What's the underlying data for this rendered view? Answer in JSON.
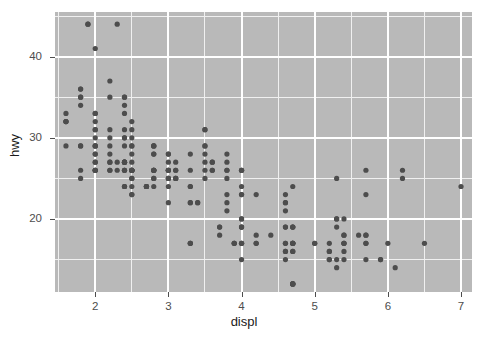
{
  "chart_data": {
    "type": "scatter",
    "title": "",
    "xlabel": "displ",
    "ylabel": "hwy",
    "xlim": [
      1.45,
      7.15
    ],
    "ylim": [
      11.0,
      45.5
    ],
    "xticks": [
      2,
      3,
      4,
      5,
      6,
      7
    ],
    "yticks": [
      20,
      30,
      40
    ],
    "xtick_labels": [
      "2",
      "3",
      "4",
      "5",
      "6",
      "7"
    ],
    "ytick_labels": [
      "20",
      "30",
      "40"
    ],
    "x_minor_ticks": [
      1.5,
      2.5,
      3.5,
      4.5,
      5.5,
      6.5
    ],
    "y_minor_ticks": [
      15,
      25,
      35,
      45
    ],
    "grid": true,
    "legend": null,
    "point_color": "#4d4d4d",
    "point_radius": 2.6,
    "panel_background": "#b9b9b9",
    "gridline_major_color": "#ffffff",
    "gridline_minor_color": "#f0f0f0",
    "plot_background": "#ffffff",
    "axis_text_color": "#4d4d4d",
    "axis_title_color": "#1a1a1a",
    "n_points": 234,
    "points": [
      [
        1.8,
        29
      ],
      [
        1.8,
        29
      ],
      [
        2.0,
        31
      ],
      [
        2.0,
        30
      ],
      [
        2.8,
        26
      ],
      [
        2.8,
        26
      ],
      [
        3.1,
        27
      ],
      [
        1.8,
        26
      ],
      [
        1.8,
        25
      ],
      [
        2.0,
        28
      ],
      [
        2.0,
        27
      ],
      [
        2.8,
        25
      ],
      [
        2.8,
        25
      ],
      [
        3.1,
        25
      ],
      [
        3.1,
        25
      ],
      [
        2.8,
        24
      ],
      [
        3.1,
        25
      ],
      [
        4.2,
        23
      ],
      [
        5.3,
        20
      ],
      [
        5.3,
        15
      ],
      [
        5.3,
        20
      ],
      [
        5.7,
        17
      ],
      [
        6.0,
        17
      ],
      [
        5.7,
        26
      ],
      [
        5.7,
        23
      ],
      [
        6.2,
        26
      ],
      [
        6.2,
        25
      ],
      [
        7.0,
        24
      ],
      [
        5.3,
        19
      ],
      [
        5.3,
        14
      ],
      [
        5.7,
        15
      ],
      [
        6.5,
        17
      ],
      [
        2.4,
        27
      ],
      [
        2.4,
        30
      ],
      [
        3.1,
        26
      ],
      [
        3.5,
        29
      ],
      [
        3.6,
        26
      ],
      [
        2.4,
        24
      ],
      [
        3.0,
        24
      ],
      [
        3.3,
        22
      ],
      [
        3.3,
        22
      ],
      [
        3.3,
        24
      ],
      [
        3.3,
        24
      ],
      [
        3.3,
        17
      ],
      [
        3.8,
        22
      ],
      [
        3.8,
        21
      ],
      [
        3.8,
        23
      ],
      [
        4.0,
        23
      ],
      [
        3.7,
        19
      ],
      [
        3.7,
        18
      ],
      [
        3.9,
        17
      ],
      [
        3.9,
        17
      ],
      [
        4.7,
        19
      ],
      [
        4.7,
        19
      ],
      [
        4.7,
        12
      ],
      [
        5.2,
        17
      ],
      [
        5.2,
        15
      ],
      [
        3.9,
        17
      ],
      [
        4.7,
        17
      ],
      [
        4.7,
        12
      ],
      [
        4.7,
        17
      ],
      [
        5.2,
        16
      ],
      [
        5.7,
        18
      ],
      [
        5.9,
        15
      ],
      [
        4.7,
        16
      ],
      [
        4.7,
        12
      ],
      [
        4.7,
        17
      ],
      [
        4.7,
        17
      ],
      [
        4.7,
        16
      ],
      [
        4.7,
        12
      ],
      [
        5.2,
        15
      ],
      [
        5.2,
        16
      ],
      [
        5.7,
        17
      ],
      [
        5.9,
        15
      ],
      [
        4.6,
        17
      ],
      [
        5.4,
        17
      ],
      [
        5.4,
        18
      ],
      [
        4.0,
        17
      ],
      [
        4.0,
        19
      ],
      [
        4.0,
        17
      ],
      [
        4.0,
        19
      ],
      [
        4.6,
        19
      ],
      [
        5.0,
        17
      ],
      [
        4.2,
        17
      ],
      [
        4.2,
        17
      ],
      [
        4.6,
        16
      ],
      [
        4.6,
        16
      ],
      [
        4.6,
        17
      ],
      [
        5.4,
        15
      ],
      [
        5.4,
        17
      ],
      [
        3.8,
        26
      ],
      [
        3.8,
        25
      ],
      [
        4.0,
        26
      ],
      [
        4.0,
        24
      ],
      [
        4.6,
        21
      ],
      [
        4.6,
        22
      ],
      [
        4.6,
        23
      ],
      [
        4.6,
        22
      ],
      [
        5.4,
        20
      ],
      [
        1.6,
        33
      ],
      [
        1.6,
        32
      ],
      [
        1.6,
        32
      ],
      [
        1.6,
        29
      ],
      [
        1.6,
        32
      ],
      [
        1.8,
        34
      ],
      [
        1.8,
        36
      ],
      [
        1.8,
        36
      ],
      [
        2.0,
        29
      ],
      [
        2.4,
        26
      ],
      [
        2.4,
        27
      ],
      [
        2.4,
        30
      ],
      [
        2.4,
        31
      ],
      [
        2.5,
        26
      ],
      [
        2.5,
        26
      ],
      [
        3.3,
        28
      ],
      [
        2.0,
        26
      ],
      [
        2.0,
        29
      ],
      [
        2.0,
        28
      ],
      [
        2.0,
        27
      ],
      [
        2.7,
        24
      ],
      [
        2.7,
        24
      ],
      [
        2.7,
        24
      ],
      [
        3.0,
        22
      ],
      [
        3.7,
        19
      ],
      [
        4.0,
        20
      ],
      [
        4.7,
        17
      ],
      [
        4.7,
        12
      ],
      [
        4.7,
        19
      ],
      [
        5.7,
        18
      ],
      [
        6.1,
        14
      ],
      [
        4.0,
        15
      ],
      [
        4.2,
        18
      ],
      [
        4.4,
        18
      ],
      [
        4.6,
        15
      ],
      [
        5.4,
        17
      ],
      [
        5.4,
        16
      ],
      [
        5.4,
        18
      ],
      [
        4.0,
        17
      ],
      [
        4.0,
        19
      ],
      [
        4.6,
        19
      ],
      [
        5.0,
        17
      ],
      [
        2.4,
        29
      ],
      [
        2.4,
        27
      ],
      [
        2.5,
        31
      ],
      [
        2.5,
        32
      ],
      [
        3.5,
        27
      ],
      [
        3.5,
        26
      ],
      [
        3.0,
        26
      ],
      [
        3.0,
        25
      ],
      [
        3.5,
        25
      ],
      [
        3.3,
        17
      ],
      [
        3.3,
        17
      ],
      [
        4.0,
        20
      ],
      [
        5.6,
        18
      ],
      [
        3.1,
        26
      ],
      [
        3.8,
        26
      ],
      [
        3.8,
        27
      ],
      [
        3.8,
        28
      ],
      [
        5.3,
        25
      ],
      [
        2.5,
        25
      ],
      [
        2.5,
        24
      ],
      [
        2.5,
        27
      ],
      [
        2.5,
        25
      ],
      [
        2.5,
        26
      ],
      [
        2.5,
        23
      ],
      [
        2.2,
        26
      ],
      [
        2.2,
        26
      ],
      [
        2.5,
        26
      ],
      [
        2.5,
        26
      ],
      [
        2.5,
        23
      ],
      [
        2.5,
        26
      ],
      [
        2.5,
        26
      ],
      [
        2.7,
        24
      ],
      [
        2.7,
        24
      ],
      [
        3.4,
        22
      ],
      [
        3.4,
        22
      ],
      [
        4.0,
        23
      ],
      [
        4.7,
        24
      ],
      [
        2.2,
        30
      ],
      [
        2.2,
        31
      ],
      [
        2.4,
        26
      ],
      [
        2.4,
        26
      ],
      [
        3.0,
        28
      ],
      [
        3.0,
        26
      ],
      [
        3.5,
        29
      ],
      [
        2.2,
        28
      ],
      [
        2.2,
        27
      ],
      [
        2.4,
        24
      ],
      [
        2.4,
        24
      ],
      [
        3.0,
        26
      ],
      [
        3.0,
        25
      ],
      [
        3.5,
        28
      ],
      [
        2.2,
        37
      ],
      [
        2.2,
        35
      ],
      [
        2.4,
        34
      ],
      [
        2.4,
        35
      ],
      [
        3.0,
        27
      ],
      [
        3.0,
        28
      ],
      [
        3.5,
        31
      ],
      [
        2.2,
        27
      ],
      [
        2.2,
        29
      ],
      [
        2.4,
        27
      ],
      [
        2.4,
        27
      ],
      [
        3.0,
        26
      ],
      [
        3.0,
        25
      ],
      [
        3.5,
        31
      ],
      [
        2.8,
        28
      ],
      [
        2.8,
        29
      ],
      [
        3.6,
        27
      ],
      [
        3.6,
        27
      ],
      [
        4.0,
        26
      ],
      [
        4.0,
        26
      ],
      [
        1.9,
        44
      ],
      [
        2.0,
        41
      ],
      [
        2.0,
        29
      ],
      [
        2.0,
        26
      ],
      [
        2.5,
        28
      ],
      [
        2.5,
        29
      ],
      [
        2.8,
        29
      ],
      [
        2.8,
        29
      ],
      [
        1.9,
        44
      ],
      [
        1.8,
        35
      ],
      [
        1.8,
        35
      ],
      [
        2.0,
        33
      ],
      [
        2.0,
        33
      ],
      [
        2.8,
        26
      ],
      [
        2.8,
        26
      ],
      [
        3.6,
        26
      ],
      [
        2.3,
        44
      ],
      [
        2.4,
        35
      ],
      [
        2.4,
        33
      ],
      [
        2.5,
        30
      ],
      [
        2.5,
        29
      ],
      [
        2.8,
        28
      ],
      [
        2.8,
        26
      ],
      [
        3.3,
        26
      ],
      [
        2.0,
        32
      ],
      [
        2.0,
        31
      ],
      [
        2.3,
        27
      ],
      [
        2.3,
        26
      ],
      [
        2.0,
        26
      ],
      [
        2.0,
        26
      ]
    ]
  }
}
